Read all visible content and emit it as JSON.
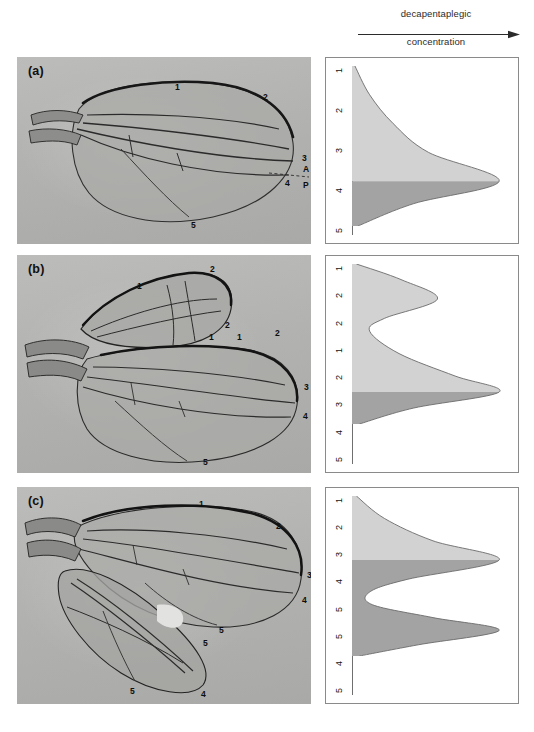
{
  "header": {
    "title_top": "decapentaplegic",
    "title_bottom": "concentration",
    "arrow_icon": "right-arrow-icon",
    "arrow_direction": "right"
  },
  "colors": {
    "curve_light": "#d2d2d2",
    "curve_dark": "#a3a3a3",
    "curve_outline": "#6b6b6b",
    "box_border": "#8a8a8a",
    "photo_background": "#b4b4b2",
    "text": "#121212"
  },
  "panels": [
    {
      "id": "a",
      "letter": "(a)",
      "photo": {
        "description": "wild-type Drosophila wing",
        "vein_labels": [
          {
            "text": "1",
            "x": 158,
            "y": 26
          },
          {
            "text": "2",
            "x": 246,
            "y": 36
          },
          {
            "text": "3",
            "x": 285,
            "y": 97
          },
          {
            "text": "4",
            "x": 268,
            "y": 122
          },
          {
            "text": "A",
            "x": 286,
            "y": 110
          },
          {
            "text": "P",
            "x": 286,
            "y": 124
          },
          {
            "text": "5",
            "x": 174,
            "y": 164
          }
        ],
        "compartment_divider": "dashed-line"
      },
      "diagram": {
        "axis_labels": [
          "1",
          "2",
          "3",
          "4",
          "5"
        ],
        "chart_ref": 0
      }
    },
    {
      "id": "b",
      "letter": "(b)",
      "photo": {
        "description": "wing with mirror-image anterior duplication",
        "vein_labels": [
          {
            "text": "2",
            "x": 193,
            "y": 10
          },
          {
            "text": "1",
            "x": 120,
            "y": 27
          },
          {
            "text": "2",
            "x": 208,
            "y": 66
          },
          {
            "text": "1",
            "x": 192,
            "y": 78
          },
          {
            "text": "1",
            "x": 220,
            "y": 78
          },
          {
            "text": "2",
            "x": 258,
            "y": 74
          },
          {
            "text": "3",
            "x": 287,
            "y": 128
          },
          {
            "text": "4",
            "x": 286,
            "y": 157
          },
          {
            "text": "5",
            "x": 186,
            "y": 203
          }
        ]
      },
      "diagram": {
        "axis_labels": [
          "1",
          "2",
          "2",
          "1",
          "2",
          "3",
          "4",
          "5"
        ],
        "chart_ref": 1
      }
    },
    {
      "id": "c",
      "letter": "(c)",
      "photo": {
        "description": "wing with mirror-image posterior duplication",
        "vein_labels": [
          {
            "text": "1",
            "x": 182,
            "y": 13
          },
          {
            "text": "2",
            "x": 259,
            "y": 35
          },
          {
            "text": "3",
            "x": 290,
            "y": 84
          },
          {
            "text": "4",
            "x": 285,
            "y": 109
          },
          {
            "text": "5",
            "x": 202,
            "y": 139
          },
          {
            "text": "5",
            "x": 186,
            "y": 150
          },
          {
            "text": "5",
            "x": 113,
            "y": 200
          },
          {
            "text": "4",
            "x": 184,
            "y": 203
          }
        ]
      },
      "diagram": {
        "axis_labels": [
          "1",
          "2",
          "3",
          "4",
          "5",
          "5",
          "4",
          "5"
        ],
        "chart_ref": 2
      }
    }
  ],
  "chart_data": [
    {
      "type": "area",
      "title": "decapentaplegic concentration profile — wild type",
      "orientation": "horizontal",
      "xlabel": "decapentaplegic concentration",
      "ylabel": "position across wing",
      "categories": [
        "1",
        "2",
        "3",
        "4",
        "5"
      ],
      "boundary_label": "4",
      "boundary_fraction": 0.72,
      "shaded_regions": [
        {
          "name": "anterior",
          "color": "#d2d2d2",
          "from": "1",
          "to": "4"
        },
        {
          "name": "posterior",
          "color": "#a3a3a3",
          "from": "4",
          "to": "5"
        }
      ],
      "peaks": [
        {
          "position_label": "4",
          "position_fraction": 0.72,
          "value": 1.0
        }
      ],
      "profile": [
        {
          "position_fraction": 0.0,
          "value": 0.02
        },
        {
          "position_fraction": 0.18,
          "value": 0.12
        },
        {
          "position_fraction": 0.36,
          "value": 0.28
        },
        {
          "position_fraction": 0.54,
          "value": 0.52
        },
        {
          "position_fraction": 0.72,
          "value": 1.0
        },
        {
          "position_fraction": 0.86,
          "value": 0.42
        },
        {
          "position_fraction": 1.0,
          "value": 0.04
        }
      ],
      "xlim": [
        0,
        1
      ],
      "grid": false,
      "legend": "none"
    },
    {
      "type": "area",
      "title": "decapentaplegic concentration profile — anterior duplication",
      "orientation": "horizontal",
      "xlabel": "decapentaplegic concentration",
      "ylabel": "position across wing",
      "categories": [
        "1",
        "2",
        "2",
        "1",
        "2",
        "3",
        "4",
        "5"
      ],
      "boundary_label": "4",
      "boundary_fraction": 0.8,
      "shaded_regions": [
        {
          "name": "anterior",
          "color": "#d2d2d2",
          "from": "1",
          "to": "4"
        },
        {
          "name": "posterior",
          "color": "#a3a3a3",
          "from": "4",
          "to": "5"
        }
      ],
      "peaks": [
        {
          "position_label": "2",
          "position_fraction": 0.22,
          "value": 0.58
        },
        {
          "position_label": "4",
          "position_fraction": 0.8,
          "value": 1.0
        }
      ],
      "profile": [
        {
          "position_fraction": 0.0,
          "value": 0.03
        },
        {
          "position_fraction": 0.1,
          "value": 0.34
        },
        {
          "position_fraction": 0.22,
          "value": 0.58
        },
        {
          "position_fraction": 0.34,
          "value": 0.22
        },
        {
          "position_fraction": 0.42,
          "value": 0.12
        },
        {
          "position_fraction": 0.56,
          "value": 0.32
        },
        {
          "position_fraction": 0.7,
          "value": 0.7
        },
        {
          "position_fraction": 0.8,
          "value": 1.0
        },
        {
          "position_fraction": 0.9,
          "value": 0.42
        },
        {
          "position_fraction": 1.0,
          "value": 0.05
        }
      ],
      "xlim": [
        0,
        1
      ],
      "grid": false,
      "legend": "none"
    },
    {
      "type": "area",
      "title": "decapentaplegic concentration profile — posterior duplication",
      "orientation": "horizontal",
      "xlabel": "decapentaplegic concentration",
      "ylabel": "position across wing",
      "categories": [
        "1",
        "2",
        "3",
        "4",
        "5",
        "5",
        "4",
        "5"
      ],
      "boundary_label": "4",
      "boundary_fraction": 0.4,
      "shaded_regions": [
        {
          "name": "anterior",
          "color": "#d2d2d2",
          "from": "1",
          "to": "4"
        },
        {
          "name": "posterior",
          "color": "#a3a3a3",
          "from": "4",
          "to": "5"
        }
      ],
      "peaks": [
        {
          "position_label": "4",
          "position_fraction": 0.4,
          "value": 1.0
        },
        {
          "position_label": "4",
          "position_fraction": 0.84,
          "value": 1.0
        }
      ],
      "profile": [
        {
          "position_fraction": 0.0,
          "value": 0.03
        },
        {
          "position_fraction": 0.14,
          "value": 0.22
        },
        {
          "position_fraction": 0.28,
          "value": 0.55
        },
        {
          "position_fraction": 0.4,
          "value": 1.0
        },
        {
          "position_fraction": 0.52,
          "value": 0.38
        },
        {
          "position_fraction": 0.6,
          "value": 0.12
        },
        {
          "position_fraction": 0.68,
          "value": 0.14
        },
        {
          "position_fraction": 0.76,
          "value": 0.55
        },
        {
          "position_fraction": 0.84,
          "value": 1.0
        },
        {
          "position_fraction": 0.93,
          "value": 0.45
        },
        {
          "position_fraction": 1.0,
          "value": 0.05
        }
      ],
      "xlim": [
        0,
        1
      ],
      "grid": false,
      "legend": "none"
    }
  ]
}
